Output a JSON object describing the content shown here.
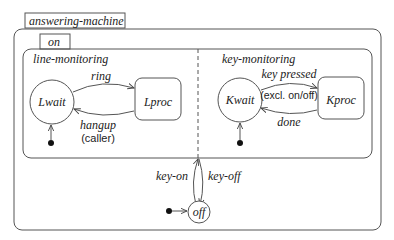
{
  "title": "answering-machine",
  "superstate": {
    "label": "on"
  },
  "regions": [
    {
      "name": "line-monitoring",
      "states": [
        "Lwait",
        "Lproc"
      ],
      "transitions": [
        {
          "from": "Lwait",
          "to": "Lproc",
          "label": "ring"
        },
        {
          "from": "Lproc",
          "to": "Lwait",
          "label": "hangup",
          "note": "(caller)"
        }
      ]
    },
    {
      "name": "key-monitoring",
      "states": [
        "Kwait",
        "Kproc"
      ],
      "transitions": [
        {
          "from": "Kwait",
          "to": "Kproc",
          "label": "key pressed",
          "note": "(excl. on/off)"
        },
        {
          "from": "Kproc",
          "to": "Kwait",
          "label": "done"
        }
      ]
    }
  ],
  "off_state": {
    "label": "off"
  },
  "outer_transitions": [
    {
      "from": "off",
      "to": "on",
      "label": "key-on"
    },
    {
      "from": "on",
      "to": "off",
      "label": "key-off"
    }
  ],
  "colors": {
    "stroke": "#555555",
    "text": "#222222",
    "background": "#ffffff"
  }
}
